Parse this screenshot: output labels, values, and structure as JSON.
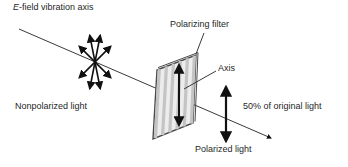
{
  "diagram": {
    "title": {
      "em": "E",
      "rest": "-field vibration axis"
    },
    "labels": {
      "polarizing_filter": "Polarizing filter",
      "axis": "Axis",
      "nonpolarized": "Nonpolarized light",
      "fifty_percent": "50% of original light",
      "polarized": "Polarized light"
    },
    "colors": {
      "background": "#ffffff",
      "thin_line": "#3a3a3a",
      "arrow": "#111111",
      "filter_fill": "#ececec",
      "filter_stripe": "#c4c4c4",
      "filter_border": "#4a4a4a",
      "text": "#1f1f1f"
    }
  }
}
